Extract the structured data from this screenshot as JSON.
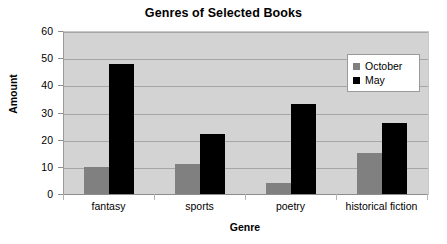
{
  "chart_data": {
    "type": "bar",
    "title": "Genres of Selected Books",
    "xlabel": "Genre",
    "ylabel": "Amount",
    "categories": [
      "fantasy",
      "sports",
      "poetry",
      "historical fiction"
    ],
    "series": [
      {
        "name": "October",
        "color": "#808080",
        "values": [
          10,
          11,
          4,
          15
        ]
      },
      {
        "name": "May",
        "color": "#000000",
        "values": [
          48,
          22,
          33,
          26
        ]
      }
    ],
    "ylim": [
      0,
      60
    ],
    "yticks": [
      0,
      10,
      20,
      30,
      40,
      50,
      60
    ],
    "ytick_labels": [
      "0",
      "10",
      "20",
      "30",
      "40",
      "50",
      "60"
    ],
    "grid": true,
    "grid_axis": "y",
    "legend_position": "upper right",
    "plot_background": "#d3d3d3",
    "figure_background": "#ffffff"
  },
  "legend": {
    "items": [
      {
        "label": "October",
        "swatch": "october-swatch"
      },
      {
        "label": "May",
        "swatch": "may-swatch"
      }
    ]
  }
}
